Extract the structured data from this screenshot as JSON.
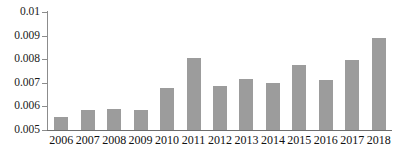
{
  "chart_data": {
    "type": "bar",
    "title": "",
    "subtitle": "",
    "xlabel": "",
    "ylabel": "",
    "categories": [
      "2006",
      "2007",
      "2008",
      "2009",
      "2010",
      "2011",
      "2012",
      "2013",
      "2014",
      "2015",
      "2016",
      "2017",
      "2018"
    ],
    "values": [
      0.00555,
      0.00585,
      0.00588,
      0.00585,
      0.00678,
      0.00805,
      0.00685,
      0.00716,
      0.00698,
      0.00775,
      0.0071,
      0.00795,
      0.00889
    ],
    "ylim": [
      0.005,
      0.01
    ],
    "ytick_values": [
      0.005,
      0.006,
      0.007,
      0.008,
      0.009,
      0.01
    ],
    "ytick_labels": [
      "0.005",
      "0.006",
      "0.007",
      "0.008",
      "0.009",
      "0.01"
    ],
    "grid": false,
    "legend": null,
    "legend_position": "none",
    "bar_color": "#9c9c9c",
    "axis_color": "#6e6e6e",
    "annotations": []
  }
}
